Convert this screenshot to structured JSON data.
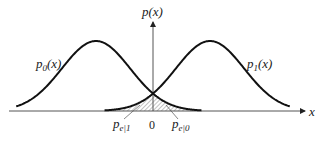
{
  "diagram": {
    "y_axis_label": {
      "main": "p(x)"
    },
    "x_axis_label": "x",
    "origin_label": "0",
    "curves": [
      {
        "name": "p",
        "sub": "0",
        "suffix": "(x)",
        "mean": -1,
        "side": "left"
      },
      {
        "name": "p",
        "sub": "1",
        "suffix": "(x)",
        "mean": 1,
        "side": "right"
      }
    ],
    "error_labels": [
      {
        "name": "p",
        "sub": "e|1"
      },
      {
        "name": "p",
        "sub": "e|0"
      }
    ],
    "colors": {
      "curve": "#111111",
      "axis": "#555555",
      "hatch": "#666666"
    }
  }
}
